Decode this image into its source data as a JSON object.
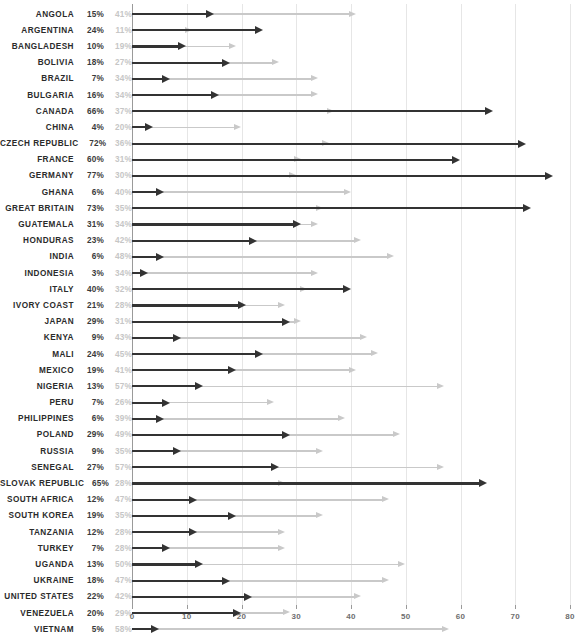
{
  "chart_data": {
    "type": "bar",
    "title": "",
    "subtitle": "",
    "xlabel": "",
    "ylabel": "",
    "xlim": [
      0,
      80
    ],
    "grid": true,
    "legend_position": "none",
    "orientation": "horizontal",
    "marker_style": "arrow",
    "axis_ticks": [
      0,
      10,
      20,
      30,
      40,
      50,
      60,
      70,
      80
    ],
    "colors": {
      "series_1": "#333333",
      "series_2": "#c9c9c9",
      "label_text": "#2b2b2b",
      "value_text_dark": "#3a3a3a",
      "value_text_light": "#c6c6c6",
      "gridline": "#e6e6e6",
      "axis": "#9a9a9a",
      "background": "#ffffff"
    },
    "series": [
      {
        "name": "series_1",
        "color": "#333333"
      },
      {
        "name": "series_2",
        "color": "#c9c9c9"
      }
    ],
    "categories": [
      "ANGOLA",
      "ARGENTINA",
      "BANGLADESH",
      "BOLIVIA",
      "BRAZIL",
      "BULGARIA",
      "CANADA",
      "CHINA",
      "CZECH REPUBLIC",
      "FRANCE",
      "GERMANY",
      "GHANA",
      "GREAT BRITAIN",
      "GUATEMALA",
      "HONDURAS",
      "INDIA",
      "INDONESIA",
      "ITALY",
      "IVORY COAST",
      "JAPAN",
      "KENYA",
      "MALI",
      "MEXICO",
      "NIGERIA",
      "PERU",
      "PHILIPPINES",
      "POLAND",
      "RUSSIA",
      "SENEGAL",
      "SLOVAK REPUBLIC",
      "SOUTH AFRICA",
      "SOUTH KOREA",
      "TANZANIA",
      "TURKEY",
      "UGANDA",
      "UKRAINE",
      "UNITED STATES",
      "VENEZUELA",
      "VIETNAM"
    ],
    "rows": [
      {
        "country": "ANGOLA",
        "v1": 15,
        "v2": 41,
        "v1_label": "15%",
        "v2_label": "41%"
      },
      {
        "country": "ARGENTINA",
        "v1": 24,
        "v2": 11,
        "v1_label": "24%",
        "v2_label": "11%"
      },
      {
        "country": "BANGLADESH",
        "v1": 10,
        "v2": 19,
        "v1_label": "10%",
        "v2_label": "19%"
      },
      {
        "country": "BOLIVIA",
        "v1": 18,
        "v2": 27,
        "v1_label": "18%",
        "v2_label": "27%"
      },
      {
        "country": "BRAZIL",
        "v1": 7,
        "v2": 34,
        "v1_label": "7%",
        "v2_label": "34%"
      },
      {
        "country": "BULGARIA",
        "v1": 16,
        "v2": 34,
        "v1_label": "16%",
        "v2_label": "34%"
      },
      {
        "country": "CANADA",
        "v1": 66,
        "v2": 37,
        "v1_label": "66%",
        "v2_label": "37%"
      },
      {
        "country": "CHINA",
        "v1": 4,
        "v2": 20,
        "v1_label": "4%",
        "v2_label": "20%"
      },
      {
        "country": "CZECH REPUBLIC",
        "v1": 72,
        "v2": 36,
        "v1_label": "72%",
        "v2_label": "36%"
      },
      {
        "country": "FRANCE",
        "v1": 60,
        "v2": 31,
        "v1_label": "60%",
        "v2_label": "31%"
      },
      {
        "country": "GERMANY",
        "v1": 77,
        "v2": 30,
        "v1_label": "77%",
        "v2_label": "30%"
      },
      {
        "country": "GHANA",
        "v1": 6,
        "v2": 40,
        "v1_label": "6%",
        "v2_label": "40%"
      },
      {
        "country": "GREAT BRITAIN",
        "v1": 73,
        "v2": 35,
        "v1_label": "73%",
        "v2_label": "35%"
      },
      {
        "country": "GUATEMALA",
        "v1": 31,
        "v2": 34,
        "v1_label": "31%",
        "v2_label": "34%"
      },
      {
        "country": "HONDURAS",
        "v1": 23,
        "v2": 42,
        "v1_label": "23%",
        "v2_label": "42%"
      },
      {
        "country": "INDIA",
        "v1": 6,
        "v2": 48,
        "v1_label": "6%",
        "v2_label": "48%"
      },
      {
        "country": "INDONESIA",
        "v1": 3,
        "v2": 34,
        "v1_label": "3%",
        "v2_label": "34%"
      },
      {
        "country": "ITALY",
        "v1": 40,
        "v2": 32,
        "v1_label": "40%",
        "v2_label": "32%"
      },
      {
        "country": "IVORY COAST",
        "v1": 21,
        "v2": 28,
        "v1_label": "21%",
        "v2_label": "28%"
      },
      {
        "country": "JAPAN",
        "v1": 29,
        "v2": 31,
        "v1_label": "29%",
        "v2_label": "31%"
      },
      {
        "country": "KENYA",
        "v1": 9,
        "v2": 43,
        "v1_label": "9%",
        "v2_label": "43%"
      },
      {
        "country": "MALI",
        "v1": 24,
        "v2": 45,
        "v1_label": "24%",
        "v2_label": "45%"
      },
      {
        "country": "MEXICO",
        "v1": 19,
        "v2": 41,
        "v1_label": "19%",
        "v2_label": "41%"
      },
      {
        "country": "NIGERIA",
        "v1": 13,
        "v2": 57,
        "v1_label": "13%",
        "v2_label": "57%"
      },
      {
        "country": "PERU",
        "v1": 7,
        "v2": 26,
        "v1_label": "7%",
        "v2_label": "26%"
      },
      {
        "country": "PHILIPPINES",
        "v1": 6,
        "v2": 39,
        "v1_label": "6%",
        "v2_label": "39%"
      },
      {
        "country": "POLAND",
        "v1": 29,
        "v2": 49,
        "v1_label": "29%",
        "v2_label": "49%"
      },
      {
        "country": "RUSSIA",
        "v1": 9,
        "v2": 35,
        "v1_label": "9%",
        "v2_label": "35%"
      },
      {
        "country": "SENEGAL",
        "v1": 27,
        "v2": 57,
        "v1_label": "27%",
        "v2_label": "57%"
      },
      {
        "country": "SLOVAK REPUBLIC",
        "v1": 65,
        "v2": 28,
        "v1_label": "65%",
        "v2_label": "28%"
      },
      {
        "country": "SOUTH AFRICA",
        "v1": 12,
        "v2": 47,
        "v1_label": "12%",
        "v2_label": "47%"
      },
      {
        "country": "SOUTH KOREA",
        "v1": 19,
        "v2": 35,
        "v1_label": "19%",
        "v2_label": "35%"
      },
      {
        "country": "TANZANIA",
        "v1": 12,
        "v2": 28,
        "v1_label": "12%",
        "v2_label": "28%"
      },
      {
        "country": "TURKEY",
        "v1": 7,
        "v2": 28,
        "v1_label": "7%",
        "v2_label": "28%"
      },
      {
        "country": "UGANDA",
        "v1": 13,
        "v2": 50,
        "v1_label": "13%",
        "v2_label": "50%"
      },
      {
        "country": "UKRAINE",
        "v1": 18,
        "v2": 47,
        "v1_label": "18%",
        "v2_label": "47%"
      },
      {
        "country": "UNITED STATES",
        "v1": 22,
        "v2": 42,
        "v1_label": "22%",
        "v2_label": "42%"
      },
      {
        "country": "VENEZUELA",
        "v1": 20,
        "v2": 29,
        "v1_label": "20%",
        "v2_label": "29%"
      },
      {
        "country": "VIETNAM",
        "v1": 5,
        "v2": 58,
        "v1_label": "5%",
        "v2_label": "58%"
      }
    ]
  }
}
